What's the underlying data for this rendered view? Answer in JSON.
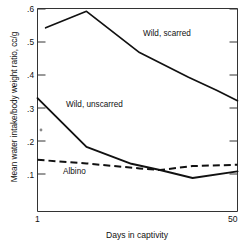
{
  "chart_data": {
    "type": "line",
    "title": "",
    "xlabel": "Days in captivity",
    "ylabel": "Mean water intake/body weight ratio, cc/g",
    "xlim": [
      1,
      50
    ],
    "ylim": [
      0.02,
      0.6
    ],
    "xticks": [
      1,
      50
    ],
    "xtick_labels": [
      "1",
      "50"
    ],
    "yticks": [
      0.1,
      0.2,
      0.3,
      0.4,
      0.5,
      0.6
    ],
    "ytick_labels": [
      ".1",
      ".2",
      ".3",
      ".4",
      ".5",
      ".6"
    ],
    "grid": false,
    "legend_position": "inline-annotations",
    "series": [
      {
        "name": "Wild, scarred",
        "style": "solid",
        "label_x": 30,
        "label_y": 0.5,
        "x": [
          3,
          13,
          26,
          38,
          45,
          50
        ],
        "values": [
          0.543,
          0.593,
          0.468,
          0.393,
          0.353,
          0.322
        ]
      },
      {
        "name": "Wild, unscarred",
        "style": "solid",
        "label_x": 11,
        "label_y": 0.305,
        "x": [
          1,
          13,
          24,
          31,
          39,
          50
        ],
        "values": [
          0.33,
          0.182,
          0.131,
          0.112,
          0.088,
          0.108
        ]
      },
      {
        "name": "Albino",
        "style": "dashed",
        "label_x": 9,
        "label_y": 0.108,
        "x": [
          1,
          13,
          26,
          31,
          39,
          50
        ],
        "values": [
          0.143,
          0.132,
          0.117,
          0.112,
          0.124,
          0.128
        ]
      }
    ]
  },
  "axis": {
    "y_title": "Mean water intake/body weight ratio, cc/g",
    "x_title": "Days in captivity",
    "x_min_label": "1",
    "x_max_label": "50",
    "y_labels": [
      ".6",
      ".5",
      ".4",
      ".3",
      ".2",
      ".1"
    ]
  },
  "annotations": {
    "scarred": "Wild, scarred",
    "unscarred": "Wild, unscarred",
    "albino": "Albino"
  },
  "colors": {
    "line": "#111111",
    "axis": "#333333",
    "background": "#ffffff"
  }
}
